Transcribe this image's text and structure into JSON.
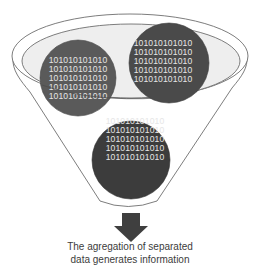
{
  "diagram": {
    "colors": {
      "funnel_outline": "#6e6e6e",
      "rim_fill": "#eeeeee",
      "circle_left": "#5a5a5a",
      "circle_right": "#4a4a4a",
      "circle_bottom": "#3c3c3c",
      "binary_text": "#e6e6e6",
      "arrow": "#3f3f3f",
      "caption_text": "#3c3c3c"
    },
    "circles": [
      {
        "name": "left",
        "lines": [
          "101010101010",
          "101010101010",
          "101010101010",
          "101010101010",
          "101010101010"
        ]
      },
      {
        "name": "right",
        "lines": [
          "101010101010",
          "101010101010",
          "101010101010",
          "101010101010",
          "101010101010"
        ]
      },
      {
        "name": "bottom",
        "lines": [
          "101010101010",
          "101010101010",
          "101010101010",
          "101010101010",
          "101010101010"
        ]
      }
    ],
    "arrow": {
      "icon": "down-arrow-icon"
    },
    "caption": {
      "line1": "The agregation of separated",
      "line2": "data generates information"
    }
  }
}
